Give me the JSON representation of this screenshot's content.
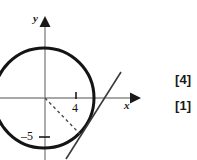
{
  "figure": {
    "axes": {
      "x_label": "x",
      "y_label": "y",
      "origin": {
        "x": 45,
        "y": 98
      }
    },
    "ticks": [
      {
        "name": "x-tick-4",
        "label": "4",
        "axis": "x",
        "value": 4,
        "px": {
          "x": 76,
          "y": 98
        }
      },
      {
        "name": "y-tick-minus-5",
        "label": "–5",
        "axis": "y",
        "value": -5,
        "px": {
          "x": 45,
          "y": 137
        }
      }
    ],
    "circle": {
      "center_px": {
        "x": 44,
        "y": 98
      },
      "radius_px": 50,
      "stroke": "#141414",
      "stroke_width": 3
    },
    "tangent_line": {
      "from_px": {
        "x": 66,
        "y": 159
      },
      "to_px": {
        "x": 121,
        "y": 72
      },
      "stroke": "#3a3a3a",
      "stroke_width": 1.6
    },
    "radius_dashed": {
      "from_px": {
        "x": 45,
        "y": 98
      },
      "to_px": {
        "x": 80,
        "y": 134
      },
      "stroke": "#4a4a4a",
      "dash": "3 3"
    },
    "colors": {
      "axis": "#8a8a8a",
      "circle": "#141414",
      "tangent": "#3a3a3a",
      "text": "#111111"
    }
  },
  "marks": {
    "first": "[4]",
    "second": "[1]"
  }
}
